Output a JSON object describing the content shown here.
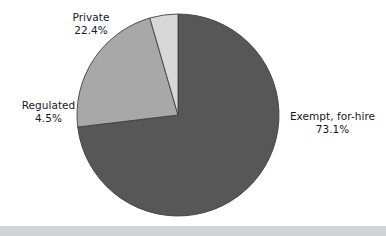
{
  "chart_data": {
    "type": "pie",
    "title": "",
    "subtitle": "",
    "xlabel": "",
    "ylabel": "",
    "legend_position": "none",
    "grid": false,
    "units": "percent",
    "start_angle_deg": 0,
    "direction": "clockwise",
    "categories": [
      "Exempt, for-hire",
      "Private",
      "Regulated"
    ],
    "values": [
      73.1,
      22.4,
      4.5
    ],
    "slices": [
      {
        "label": "Exempt, for-hire",
        "value": 73.1,
        "value_text": "73.1%",
        "color": "#575757",
        "label_position": "right"
      },
      {
        "label": "Private",
        "value": 22.4,
        "value_text": "22.4%",
        "color": "#a8a8a8",
        "label_position": "top-left"
      },
      {
        "label": "Regulated",
        "value": 4.5,
        "value_text": "4.5%",
        "color": "#d8d8d8",
        "label_position": "left"
      }
    ]
  },
  "labels": {
    "private": {
      "name": "Private",
      "value": "22.4%"
    },
    "regulated": {
      "name": "Regulated",
      "value": "4.5%"
    },
    "exempt": {
      "name": "Exempt, for-hire",
      "value": "73.1%"
    }
  },
  "colors": {
    "background": "#ffffff",
    "slice_exempt": "#575757",
    "slice_private": "#a8a8a8",
    "slice_regulated": "#d8d8d8",
    "slice_outline": "#3f3f3f",
    "label_text": "#16181a",
    "bottom_band": "#d1d3d5"
  },
  "geometry": {
    "center_x": 178,
    "center_y": 115,
    "radius": 101
  }
}
